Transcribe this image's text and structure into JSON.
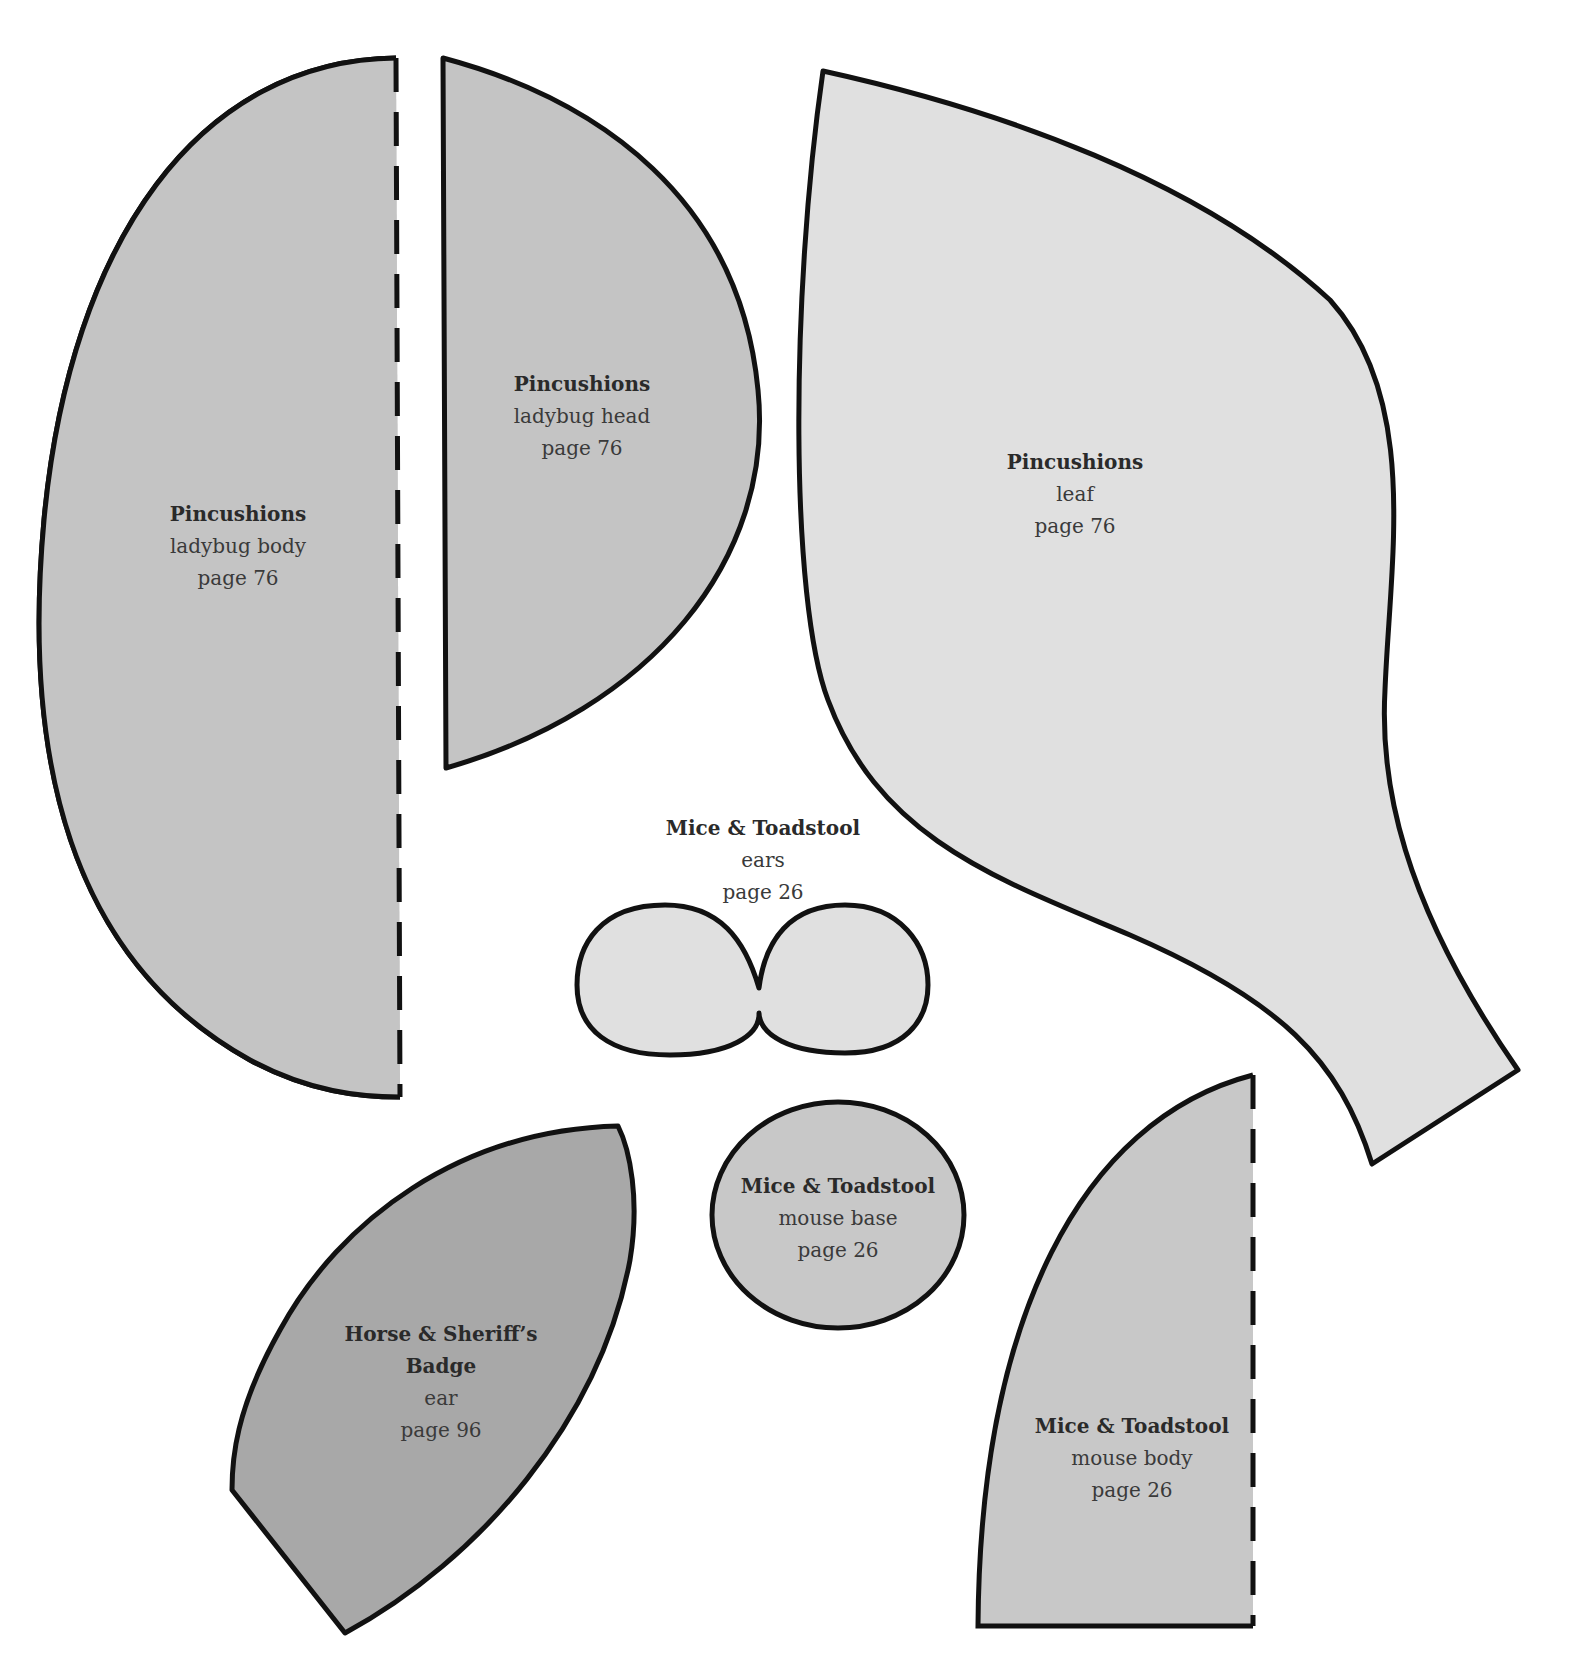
{
  "document": {
    "type": "sewing pattern templates sheet",
    "background": "#ffffff",
    "outline_color": "#111111"
  },
  "pieces": [
    {
      "id": "ladybug-body",
      "project": "Pincushions",
      "part": "ladybug body",
      "page": "page 76",
      "fill": "#c4c4c4",
      "fold_line": "dashed"
    },
    {
      "id": "ladybug-head",
      "project": "Pincushions",
      "part": "ladybug head",
      "page": "page 76",
      "fill": "#c4c4c4"
    },
    {
      "id": "leaf",
      "project": "Pincushions",
      "part": "leaf",
      "page": "page 76",
      "fill": "#e0e0e0"
    },
    {
      "id": "mouse-ears",
      "project": "Mice & Toadstool",
      "part": "ears",
      "page": "page 26",
      "fill": "#e0e0e0"
    },
    {
      "id": "mouse-base",
      "project": "Mice & Toadstool",
      "part": "mouse base",
      "page": "page 26",
      "fill": "#c8c8c8"
    },
    {
      "id": "horse-ear",
      "project_line1": "Horse & Sheriff’s",
      "project_line2": "Badge",
      "part": "ear",
      "page": "page 96",
      "fill": "#a8a8a8"
    },
    {
      "id": "mouse-body",
      "project": "Mice & Toadstool",
      "part": "mouse body",
      "page": "page 26",
      "fill": "#c8c8c8",
      "fold_line": "dashed"
    }
  ]
}
